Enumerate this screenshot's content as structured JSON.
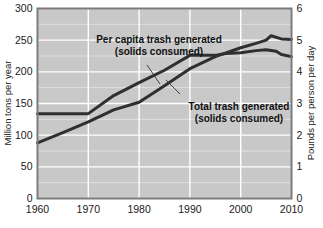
{
  "chart_data": {
    "type": "line",
    "title": "",
    "xlabel": "",
    "ylabel": "Million tons per year",
    "y2label": "Pounds per person per day",
    "xlim": [
      1960,
      2010
    ],
    "ylim": [
      0,
      300
    ],
    "y2lim": [
      0,
      6
    ],
    "xticks": [
      "1960",
      "1970",
      "1980",
      "1990",
      "2000",
      "2010"
    ],
    "yticks": [
      "0",
      "50",
      "100",
      "150",
      "200",
      "250",
      "300"
    ],
    "y2ticks": [
      "0",
      "1",
      "2",
      "3",
      "4",
      "5",
      "6"
    ],
    "grid": true,
    "grid_minor_y": 25,
    "legend": "none",
    "series": [
      {
        "name": "Per capita trash generated (solids consumed)",
        "axis": "right",
        "unit": "pounds per person per day",
        "x": [
          1960,
          1965,
          1970,
          1975,
          1980,
          1985,
          1990,
          1995,
          1997,
          2000,
          2003,
          2005,
          2007,
          2008,
          2010
        ],
        "values": [
          2.68,
          2.68,
          2.68,
          3.25,
          3.66,
          4.05,
          4.52,
          4.52,
          4.58,
          4.6,
          4.67,
          4.7,
          4.65,
          4.55,
          4.48
        ]
      },
      {
        "name": "Total trash generated (solids consumed)",
        "axis": "left",
        "unit": "million tons per year",
        "x": [
          1960,
          1965,
          1970,
          1975,
          1980,
          1985,
          1990,
          1995,
          2000,
          2003,
          2005,
          2006,
          2008,
          2010
        ],
        "values": [
          88,
          104,
          121,
          140,
          152,
          178,
          205,
          224,
          238,
          245,
          250,
          257,
          252,
          251
        ]
      }
    ],
    "annotations": [
      {
        "id": "per-capita",
        "line1": "Per capita trash generated",
        "line2": "(solids consumed)",
        "leader_from": [
          147,
          65
        ],
        "leader_to": [
          160,
          84
        ]
      },
      {
        "id": "total",
        "line1": "Total trash generated",
        "line2": "(solids consumed)",
        "leader_from": [
          180,
          94
        ],
        "leader_to": [
          166,
          80
        ]
      }
    ],
    "colors": {
      "plot_background": "#c8c8c8",
      "gridline": "#ffffff",
      "series_line": "#2f2f2f",
      "frame": "#7a7a7a",
      "text": "#111111"
    }
  }
}
